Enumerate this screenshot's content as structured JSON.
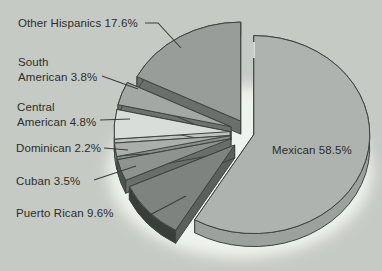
{
  "background": "#c6cac5",
  "outline_color": "#3f433f",
  "leader_color": "#3c403c",
  "glow": {
    "cx": 240,
    "cy": 172,
    "rx": 132,
    "ry": 86,
    "color": "#f3f7f1"
  },
  "edge_highlight": {
    "x": 254,
    "y1": 42,
    "y2": 58,
    "color": "#eef2ee"
  },
  "chart_data": {
    "type": "pie",
    "style": "3d-exploded-pie",
    "title": "",
    "unit": "%",
    "legend_position": "none",
    "categories": [
      "Mexican",
      "Puerto Rican",
      "Cuban",
      "Dominican",
      "Central American",
      "South American",
      "Other Hispanics"
    ],
    "values": [
      58.5,
      9.6,
      3.5,
      2.2,
      4.8,
      3.8,
      17.6
    ],
    "geometry": {
      "cx": 248,
      "cy": 133,
      "rx": 116,
      "ry": 99,
      "depth": 13,
      "start_angle_deg": 0,
      "direction": "clockwise"
    },
    "slices": [
      {
        "name": "Mexican",
        "value": 58.5,
        "label": "Mexican 58.5%",
        "top": "#afb3af",
        "side": "#9da19d",
        "cut": "#949894",
        "explode": 6,
        "label_pos": {
          "x": 272,
          "y": 143
        },
        "leader": null
      },
      {
        "name": "Puerto Rican",
        "value": 9.6,
        "label": "Puerto Rican 9.6%",
        "top": "#7f837f",
        "side": "#3a3e3a",
        "cut": "#5c605c",
        "explode": 18,
        "label_pos": {
          "x": 16,
          "y": 206
        },
        "leader": [
          [
            146,
            217
          ],
          [
            186,
            196
          ]
        ]
      },
      {
        "name": "Cuban",
        "value": 3.5,
        "label": "Cuban 3.5%",
        "top": "#8f938f",
        "side": "#4e524e",
        "cut": "#6a6e6a",
        "explode": 18,
        "label_pos": {
          "x": 16,
          "y": 174
        },
        "leader": [
          [
            94,
            180
          ],
          [
            136,
            166
          ]
        ]
      },
      {
        "name": "Dominican",
        "value": 2.2,
        "label": "Dominican 2.2%",
        "top": "#abafab",
        "side": "#787c78",
        "cut": "#8a8e8a",
        "explode": 18,
        "label_pos": {
          "x": 16,
          "y": 141
        },
        "leader": [
          [
            104,
            148
          ],
          [
            128,
            150
          ]
        ]
      },
      {
        "name": "Central American",
        "value": 4.8,
        "label": "Central\nAmerican 4.8%",
        "top": "#d9ddd9",
        "side": "#c2c6c2",
        "cut": "#bec2be",
        "explode": 18,
        "label_pos": {
          "x": 17,
          "y": 100
        },
        "leader": [
          [
            100,
            120
          ],
          [
            130,
            119
          ]
        ]
      },
      {
        "name": "South American",
        "value": 3.8,
        "label": "South\nAmerican 3.8%",
        "top": "#a4a8a4",
        "side": "#6e726e",
        "cut": "#6e726e",
        "explode": 18,
        "label_pos": {
          "x": 18,
          "y": 55
        },
        "leader": [
          [
            102,
            76
          ],
          [
            138,
            89
          ]
        ]
      },
      {
        "name": "Other Hispanics",
        "value": 17.6,
        "label": "Other Hispanics 17.6%",
        "top": "#999d99",
        "side": "#6b6f6b",
        "cut": "#6b6f6b",
        "explode": 14,
        "label_pos": {
          "x": 18,
          "y": 16
        },
        "leader": [
          [
            145,
            23
          ],
          [
            158,
            23
          ],
          [
            181,
            48
          ]
        ]
      }
    ]
  }
}
